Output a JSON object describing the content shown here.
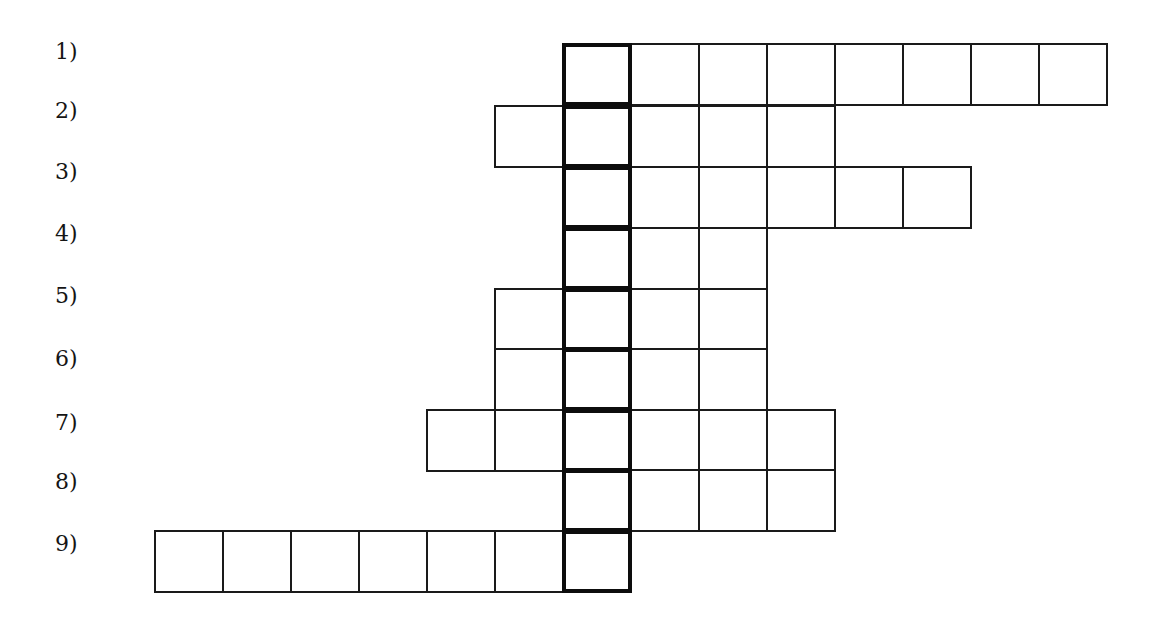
{
  "puzzle": {
    "type": "crossword-keyword",
    "geometry": {
      "origin_x": 155,
      "cell_width": 68,
      "cell_height": 61,
      "key_column": 6,
      "row_tops": [
        44,
        106,
        167,
        228,
        289,
        349,
        410,
        470,
        531
      ],
      "label_tops": [
        40,
        99,
        160,
        222,
        284,
        347,
        411,
        470,
        532
      ]
    },
    "colors": {
      "line": "#1a1a1a",
      "key_line": "#0d0d0d",
      "background": "#ffffff",
      "text": "#151515"
    },
    "rows": [
      {
        "label": "1)",
        "start_col": 6,
        "length": 8
      },
      {
        "label": "2)",
        "start_col": 5,
        "length": 5
      },
      {
        "label": "3)",
        "start_col": 6,
        "length": 6
      },
      {
        "label": "4)",
        "start_col": 6,
        "length": 3
      },
      {
        "label": "5)",
        "start_col": 5,
        "length": 4
      },
      {
        "label": "6)",
        "start_col": 5,
        "length": 4
      },
      {
        "label": "7)",
        "start_col": 4,
        "length": 6
      },
      {
        "label": "8)",
        "start_col": 6,
        "length": 4
      },
      {
        "label": "9)",
        "start_col": 0,
        "length": 7
      }
    ]
  }
}
